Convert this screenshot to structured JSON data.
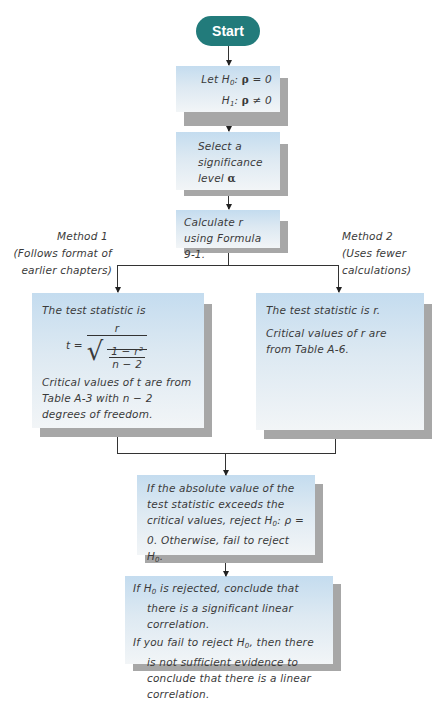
{
  "diagram": {
    "type": "flowchart",
    "colors": {
      "start_fill": "#227b7b",
      "box_fill_top": "#c4dcef",
      "box_fill_bottom": "#f2f5f7",
      "shadow": "#a7a7a7",
      "line": "#333333"
    },
    "start": {
      "label": "Start"
    },
    "hypotheses": {
      "line1_prefix": "Let H",
      "line1_sub": "0",
      "line1_rho": "ρ",
      "line1_suffix": " = 0",
      "line2_prefix": "H",
      "line2_sub": "1",
      "line2_rho": "ρ",
      "line2_suffix": " ≠ 0"
    },
    "significance": {
      "text": "Select a significance level",
      "symbol": "α"
    },
    "calculate": {
      "text": "Calculate r using Formula 9-1."
    },
    "method1": {
      "title": "Method 1",
      "subtitle": "(Follows format of earlier chapters)",
      "box_intro": "The test statistic is",
      "formula_lhs": "t =",
      "formula_num": "r",
      "formula_inner_num": "1 − r²",
      "formula_inner_den": "n − 2",
      "critical": "Critical values of t are from Table A-3 with n − 2 degrees of freedom."
    },
    "method2": {
      "title": "Method 2",
      "subtitle": "(Uses fewer calculations)",
      "box_line1": "The test statistic is r.",
      "box_line2": "Critical values of r are from Table A-6."
    },
    "decision": {
      "text1": "If the absolute value of the test statistic exceeds the critical values, reject H",
      "sub0": "0",
      "text2": ": ρ = 0. Otherwise, fail to reject H",
      "text3": "."
    },
    "conclusion": {
      "para1_a": "If H",
      "para1_sub": "0",
      "para1_b": " is rejected, conclude that there is a significant linear correlation.",
      "para2_a": "If you fail to reject H",
      "para2_sub": "0",
      "para2_b": ", then there is not sufficient evidence to conclude that there is a linear correlation."
    }
  }
}
